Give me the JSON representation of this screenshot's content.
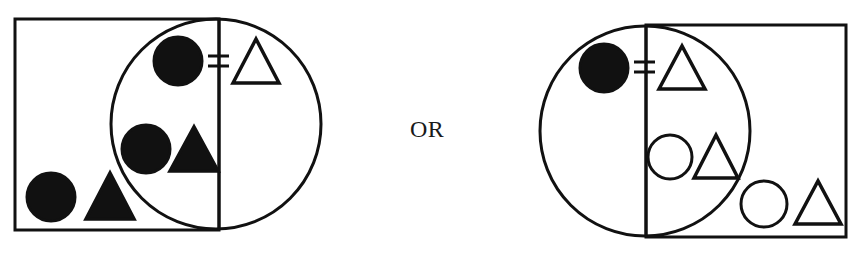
{
  "colors": {
    "ink": "#111111",
    "background": "#ffffff"
  },
  "separator": {
    "label": "OR"
  },
  "figures": [
    {
      "name": "left-venn",
      "rectangle": {
        "x": 15,
        "y": 19,
        "w": 204,
        "h": 211
      },
      "circle": {
        "cx": 216,
        "cy": 124,
        "r": 105
      },
      "divider_x": 219,
      "items": [
        {
          "shape": "circle",
          "fill": "filled",
          "cx": 178,
          "cy": 61,
          "r": 24
        },
        {
          "shape": "not-equal-sign",
          "x1": 208,
          "x2": 229,
          "y1": 56,
          "y2": 66
        },
        {
          "shape": "triangle",
          "fill": "open",
          "points": "233,83 256,39 279,83"
        },
        {
          "shape": "circle",
          "fill": "filled",
          "cx": 146,
          "cy": 149,
          "r": 24
        },
        {
          "shape": "triangle",
          "fill": "filled",
          "points": "170,171 194,127 218,171"
        },
        {
          "shape": "circle",
          "fill": "filled",
          "cx": 51,
          "cy": 197,
          "r": 24
        },
        {
          "shape": "triangle",
          "fill": "filled",
          "points": "86,219 110,173 134,219"
        }
      ]
    },
    {
      "name": "right-venn",
      "rectangle": {
        "x": 646,
        "y": 25,
        "w": 200,
        "h": 212
      },
      "circle": {
        "cx": 645,
        "cy": 131,
        "r": 105
      },
      "divider_x": 646,
      "items": [
        {
          "shape": "circle",
          "fill": "filled",
          "cx": 604,
          "cy": 68,
          "r": 24
        },
        {
          "shape": "not-equal-sign",
          "x1": 634,
          "x2": 655,
          "y1": 62,
          "y2": 72
        },
        {
          "shape": "triangle",
          "fill": "open",
          "points": "659,89 682,46 705,89"
        },
        {
          "shape": "circle",
          "fill": "open",
          "cx": 670,
          "cy": 157,
          "r": 22
        },
        {
          "shape": "triangle",
          "fill": "open",
          "points": "694,178 716,135 738,178"
        },
        {
          "shape": "circle",
          "fill": "open",
          "cx": 764,
          "cy": 204,
          "r": 23
        },
        {
          "shape": "triangle",
          "fill": "open",
          "points": "795,224 818,181 841,224"
        }
      ]
    }
  ]
}
